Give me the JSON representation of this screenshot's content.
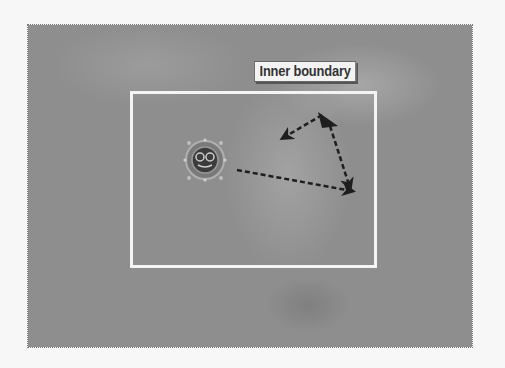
{
  "figure": {
    "label": "Inner boundary",
    "colors": {
      "background": "#8e8e8e",
      "boundary": "#f4f4f4",
      "arrows": "#1e1e1e"
    }
  },
  "elements": {
    "character": "porthole-character",
    "path_arrows": [
      {
        "from": [
          218,
          168
        ],
        "to": [
          352,
          190
        ]
      },
      {
        "from": [
          335,
          126
        ],
        "to": [
          352,
          190
        ]
      },
      {
        "from": [
          322,
          115
        ],
        "to": [
          280,
          140
        ]
      }
    ]
  }
}
